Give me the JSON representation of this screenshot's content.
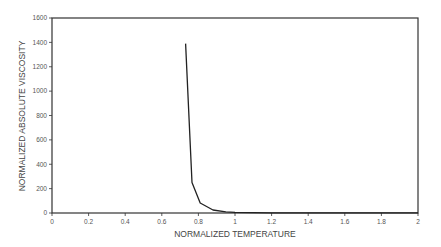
{
  "chart_data": {
    "type": "line",
    "title": "",
    "xlabel": "NORMALIZED TEMPERATURE",
    "ylabel": "NORMALIZED ABSOLUTE VISCOSITY",
    "xlim": [
      0,
      2
    ],
    "ylim": [
      0,
      1600
    ],
    "x_ticks": [
      "0",
      "0.2",
      "0.4",
      "0.6",
      "0.8",
      "1",
      "1.2",
      "1.4",
      "1.6",
      "1.8",
      "2"
    ],
    "y_ticks": [
      "0",
      "200",
      "400",
      "600",
      "800",
      "1000",
      "1200",
      "1400",
      "1600"
    ],
    "grid": false,
    "legend": null,
    "series": [
      {
        "name": "viscosity",
        "color": "#222222",
        "x": [
          0.73,
          0.765,
          0.81,
          0.88,
          0.95,
          1.0,
          1.1,
          1.2,
          1.4,
          1.6,
          1.8,
          2.0
        ],
        "y": [
          1390,
          250,
          82,
          25,
          10,
          5,
          3,
          2,
          1,
          1,
          1,
          1
        ]
      }
    ]
  }
}
